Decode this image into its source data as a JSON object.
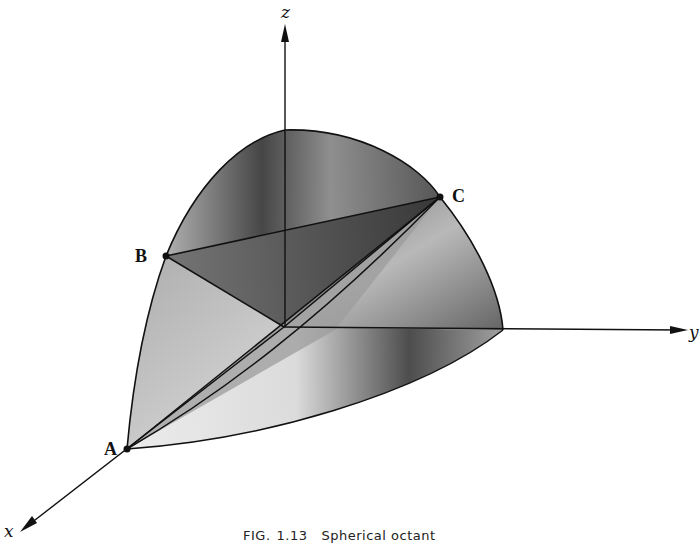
{
  "figure": {
    "axes": {
      "x_label": "x",
      "y_label": "y",
      "z_label": "z"
    },
    "points": {
      "A": "A",
      "B": "B",
      "C": "C"
    },
    "caption": {
      "prefix": "FIG.",
      "number": "1.13",
      "text": "Spherical octant"
    },
    "colors": {
      "stroke": "#111111",
      "shade_dark": "#2a2a2a",
      "shade_mid": "#7a7a7a",
      "shade_light": "#e6e6e6",
      "background": "#ffffff"
    }
  }
}
